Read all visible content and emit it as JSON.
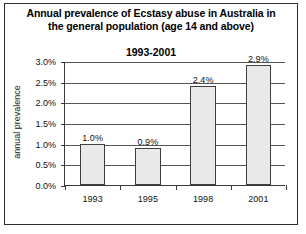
{
  "chart_data": {
    "type": "bar",
    "title": "Annual prevalence of Ecstasy abuse in Australia in the general population (age 14 and above)",
    "subtitle": "1993-2001",
    "xlabel": "",
    "ylabel": "annual prevalence",
    "categories": [
      "1993",
      "1995",
      "1998",
      "2001"
    ],
    "values": [
      1.0,
      0.9,
      2.4,
      2.9
    ],
    "data_labels": [
      "1.0%",
      "0.9%",
      "2.4%",
      "2.9%"
    ],
    "ylim": [
      0,
      3.0
    ],
    "yticks": [
      0.0,
      0.5,
      1.0,
      1.5,
      2.0,
      2.5,
      3.0
    ],
    "ytick_labels": [
      "0.0%",
      "0.5%",
      "1.0%",
      "1.5%",
      "2.0%",
      "2.5%",
      "3.0%"
    ],
    "grid": true,
    "legend": null,
    "series": [
      {
        "name": "annual prevalence",
        "values": [
          1.0,
          0.9,
          2.4,
          2.9
        ]
      }
    ],
    "colors": {
      "bar_fill": "#e9e9e9",
      "bar_border": "#3f3f3f",
      "gridline": "#555555",
      "axis": "#3a3a3a",
      "text": "#111111",
      "frame": "#2b2b2b"
    }
  }
}
